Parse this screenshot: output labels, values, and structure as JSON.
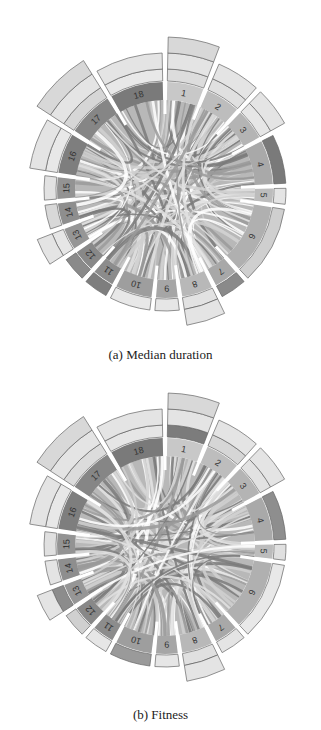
{
  "figure": {
    "panels": [
      {
        "id": "a",
        "caption": "(a) Median duration",
        "segments": [
          "1",
          "2",
          "3",
          "4",
          "5",
          "6",
          "7",
          "8",
          "9",
          "10",
          "11",
          "12",
          "13",
          "14",
          "15",
          "16",
          "17",
          "18"
        ]
      },
      {
        "id": "b",
        "caption": "(b) Fitness",
        "segments": [
          "1",
          "2",
          "3",
          "4",
          "5",
          "6",
          "7",
          "8",
          "9",
          "10",
          "11",
          "12",
          "13",
          "14",
          "15",
          "16",
          "17",
          "18"
        ]
      }
    ]
  },
  "chart_data": [
    {
      "type": "chord",
      "title": "(a) Median duration",
      "nodes": [
        "1",
        "2",
        "3",
        "4",
        "5",
        "6",
        "7",
        "8",
        "9",
        "10",
        "11",
        "12",
        "13",
        "14",
        "15",
        "16",
        "17",
        "18"
      ],
      "outer_ring_extension": {
        "1": 3,
        "2": 2,
        "3": 2,
        "4": 1,
        "5": 1,
        "6": 1,
        "7": 1,
        "8": 2,
        "9": 1,
        "10": 1,
        "11": 1,
        "12": 1,
        "13": 2,
        "14": 1,
        "15": 1,
        "16": 2,
        "17": 3,
        "18": 2
      },
      "colors": {
        "dark": "#6e6e6e",
        "mid": "#9a9a9a",
        "light": "#c8c8c8",
        "pale": "#e4e4e4"
      }
    },
    {
      "type": "chord",
      "title": "(b) Fitness",
      "nodes": [
        "1",
        "2",
        "3",
        "4",
        "5",
        "6",
        "7",
        "8",
        "9",
        "10",
        "11",
        "12",
        "13",
        "14",
        "15",
        "16",
        "17",
        "18"
      ],
      "outer_ring_extension": {
        "1": 3,
        "2": 2,
        "3": 2,
        "4": 1,
        "5": 1,
        "6": 1,
        "7": 1,
        "8": 2,
        "9": 1,
        "10": 1,
        "11": 1,
        "12": 1,
        "13": 2,
        "14": 1,
        "15": 1,
        "16": 2,
        "17": 3,
        "18": 2
      },
      "colors": {
        "dark": "#6e6e6e",
        "mid": "#9a9a9a",
        "light": "#c8c8c8",
        "pale": "#e4e4e4"
      }
    }
  ]
}
